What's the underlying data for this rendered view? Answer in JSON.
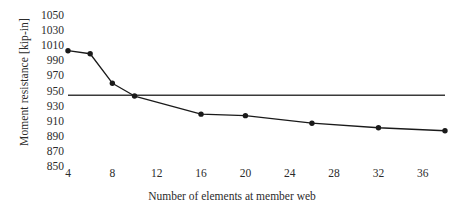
{
  "chart_data": {
    "type": "line",
    "title": "",
    "xlabel": "Number of elements at member web",
    "ylabel": "Moment resistance [kip-in]",
    "xlim": [
      4,
      38
    ],
    "ylim": [
      850,
      1050
    ],
    "xticks": [
      4,
      8,
      12,
      16,
      20,
      24,
      28,
      32,
      36
    ],
    "yticks": [
      1050,
      1030,
      1010,
      990,
      970,
      950,
      930,
      910,
      890,
      870,
      850
    ],
    "grid": false,
    "legend": "none",
    "series": [
      {
        "name": "Moment resistance",
        "marker": "filled-circle",
        "color": "#1a1a1a",
        "x": [
          4,
          6,
          8,
          10,
          16,
          20,
          26,
          32,
          38
        ],
        "y": [
          1004,
          1000,
          961,
          944,
          920,
          918,
          908,
          902,
          898
        ]
      }
    ],
    "reference_lines": [
      {
        "name": "reference-level",
        "orientation": "horizontal",
        "value": 945,
        "color": "#3a3a3a",
        "x_start": 4,
        "x_end": 38
      }
    ]
  },
  "axis": {
    "y_tick_labels": [
      "1050",
      "1030",
      "1010",
      "990",
      "970",
      "950",
      "930",
      "910",
      "890",
      "870",
      "850"
    ],
    "x_tick_labels": [
      "4",
      "8",
      "12",
      "16",
      "20",
      "24",
      "28",
      "32",
      "36"
    ]
  }
}
